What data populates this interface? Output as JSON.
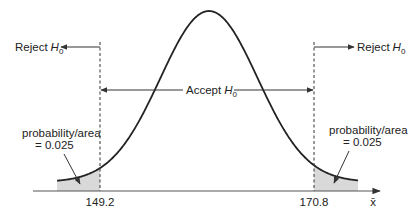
{
  "diagram": {
    "colors": {
      "curve": "#222222",
      "axis": "#555555",
      "shade": "#d9d9d9",
      "text": "#222222"
    },
    "labels": {
      "reject_left": "Reject",
      "reject_right": "Reject",
      "accept": "Accept",
      "hypothesis_symbol": "H",
      "hypothesis_subscript": "0",
      "area_left_line1": "probability/area",
      "area_left_line2": "= 0.025",
      "area_right_line1": "probability/area",
      "area_right_line2": "= 0.025",
      "critical_left": "149.2",
      "critical_right": "170.8",
      "axis_variable": "x̄"
    },
    "critical_values": [
      149.2,
      170.8
    ],
    "tail_probability": 0.025
  },
  "chart_data": {
    "type": "area",
    "xlabel": "x̄",
    "ylabel": "",
    "distribution": "normal",
    "mean": 160.0,
    "critical_values": {
      "lower": 149.2,
      "upper": 170.8
    },
    "regions": [
      {
        "name": "Reject H0",
        "range": [
          "-inf",
          149.2
        ],
        "probability": 0.025,
        "shaded": true
      },
      {
        "name": "Accept H0",
        "range": [
          149.2,
          170.8
        ],
        "probability": 0.95,
        "shaded": false
      },
      {
        "name": "Reject H0",
        "range": [
          170.8,
          "inf"
        ],
        "probability": 0.025,
        "shaded": true
      }
    ],
    "annotations": [
      "probability/area = 0.025",
      "probability/area = 0.025",
      "Accept H0",
      "Reject H0",
      "Reject H0"
    ],
    "grid": false,
    "legend": null
  }
}
